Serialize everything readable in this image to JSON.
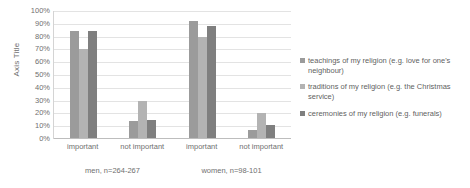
{
  "chart_data": {
    "type": "bar",
    "title": "",
    "xlabel": "",
    "ylabel": "Axis Title",
    "ylim": [
      0,
      100
    ],
    "grid": true,
    "legend_position": "right",
    "categories": [
      "important",
      "not important",
      "important",
      "not important"
    ],
    "group_labels": [
      "men, n=264-267",
      "women, n=98-101"
    ],
    "y_ticks": [
      "100%",
      "90%",
      "80%",
      "70%",
      "60%",
      "50%",
      "40%",
      "30%",
      "20%",
      "10%",
      "0%"
    ],
    "series": [
      {
        "name": "teachings of my religion (e.g. love for one's neighbour)",
        "color": "#9b9b9b",
        "values": [
          84,
          14,
          92,
          7
        ]
      },
      {
        "name": "traditions of my religion (e.g. the Christmas service)",
        "color": "#b3b3b3",
        "values": [
          70,
          30,
          80,
          20
        ]
      },
      {
        "name": "ceremonies of my religion (e.g. funerals)",
        "color": "#7f7f7f",
        "values": [
          84,
          15,
          88,
          11
        ]
      }
    ]
  },
  "legend": {
    "items": [
      {
        "label": "teachings of my religion (e.g. love for one's neighbour)",
        "color": "#9b9b9b"
      },
      {
        "label": "traditions of my religion (e.g. the Christmas service)",
        "color": "#b3b3b3"
      },
      {
        "label": "ceremonies of my religion (e.g. funerals)",
        "color": "#7f7f7f"
      }
    ]
  }
}
